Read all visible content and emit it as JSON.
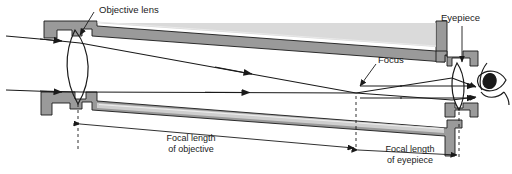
{
  "figure": {
    "background_color": "#ffffff",
    "line_color": "#1a1a1a",
    "tube_fill": "#9a9a9a",
    "tube_highlight": "#d8d8d8",
    "width": 512,
    "height": 174
  },
  "labels": {
    "objective_lens": "Objective lens",
    "focus": "Focus",
    "eyepiece": "Eyepiece",
    "focal_length_objective_line1": "Focal length",
    "focal_length_objective_line2": "of objective",
    "focal_length_eyepiece_line1": "Focal length",
    "focal_length_eyepiece_line2": "of eyepiece"
  },
  "components": [
    {
      "name": "objective-lens",
      "type": "biconvex-lens",
      "label": "Objective lens"
    },
    {
      "name": "telescope-tube",
      "type": "tapered-tube"
    },
    {
      "name": "focus-point",
      "type": "ray-crossing",
      "label": "Focus"
    },
    {
      "name": "eyepiece-lens",
      "type": "biconvex-lens",
      "label": "Eyepiece"
    },
    {
      "name": "observer-eye",
      "type": "eye-profile"
    }
  ],
  "rays": [
    {
      "name": "upper-incoming-ray",
      "direction": "left-to-right",
      "arrowheads": 2
    },
    {
      "name": "lower-incoming-ray",
      "direction": "left-to-right",
      "arrowheads": 2
    },
    {
      "name": "upper-exit-ray",
      "direction": "left-to-right",
      "arrowheads": 1
    },
    {
      "name": "lower-exit-ray",
      "direction": "left-to-right",
      "arrowheads": 1
    }
  ],
  "dimensions": [
    {
      "name": "focal-length-objective",
      "label_line1": "Focal length",
      "label_line2": "of objective"
    },
    {
      "name": "focal-length-eyepiece",
      "label_line1": "Focal length",
      "label_line2": "of eyepiece"
    }
  ]
}
